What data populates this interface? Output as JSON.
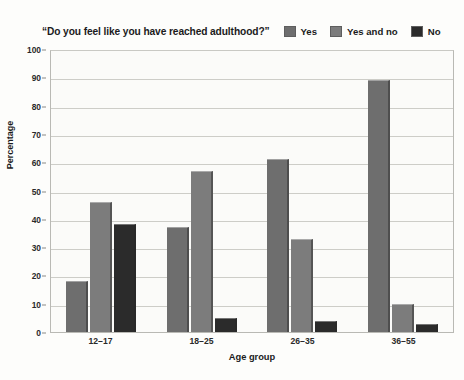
{
  "chart_data": {
    "type": "bar",
    "title": "“Do you feel like you have reached adulthood?”",
    "xlabel": "Age group",
    "ylabel": "Percentage",
    "ylim": [
      0,
      100
    ],
    "ytick_step": 10,
    "yticks": [
      "100",
      "90",
      "80",
      "70",
      "60",
      "50",
      "40",
      "30",
      "20",
      "10",
      "0"
    ],
    "grid": true,
    "legend_position": "top-right",
    "categories": [
      "12–17",
      "18–25",
      "26–35",
      "36–55"
    ],
    "series": [
      {
        "name": "Yes",
        "color": "#6e6e6e",
        "values": [
          18,
          37,
          61,
          89
        ]
      },
      {
        "name": "Yes and no",
        "color": "#7c7c7c",
        "values": [
          46,
          57,
          33,
          10
        ]
      },
      {
        "name": "No",
        "color": "#2b2b2b",
        "values": [
          38,
          5,
          4,
          3
        ]
      }
    ]
  },
  "legend": {
    "items": [
      {
        "label": "Yes",
        "swatch_color": "#6e6e6e"
      },
      {
        "label": "Yes and no",
        "swatch_color": "#7c7c7c"
      },
      {
        "label": "No",
        "swatch_color": "#2b2b2b"
      }
    ]
  },
  "colors": {
    "background": "#fdfdfb",
    "plot_background": "#fbfbf9",
    "gridline": "#cdcdc8",
    "axis": "#b9b9b4",
    "text": "#1b1b1b"
  }
}
